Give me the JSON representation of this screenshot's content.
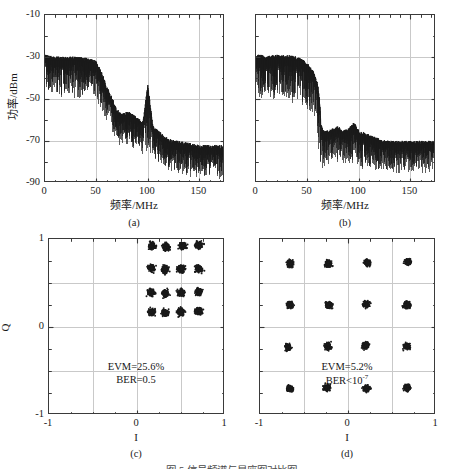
{
  "figure": {
    "caption": "图 5 信号频谱与星座图对比图",
    "panels": [
      {
        "id": "a",
        "label": "(a)",
        "type": "spectrum",
        "xlabel": "频率/MHz",
        "ylabel": "功率/dBm"
      },
      {
        "id": "b",
        "label": "(b)",
        "type": "spectrum",
        "xlabel": "频率/MHz",
        "ylabel": ""
      },
      {
        "id": "c",
        "label": "(c)",
        "type": "constellation",
        "xlabel": "I",
        "ylabel": "Q",
        "evm": "EVM=25.6%",
        "ber": "BER=0.5"
      },
      {
        "id": "d",
        "label": "(d)",
        "type": "constellation",
        "xlabel": "I",
        "ylabel": "",
        "evm": "EVM=5.2%",
        "ber_prefix": "BER<10",
        "ber_exponent": "-7"
      }
    ]
  },
  "colors": {
    "trace": "#1a1a1a",
    "frame": "#3a3a3a",
    "grid": "#c9c9c9",
    "background": "#ffffff"
  },
  "chart_data": [
    {
      "type": "line",
      "panel": "a",
      "title": "",
      "xlabel": "频率/MHz",
      "ylabel": "功率/dBm",
      "xlim": [
        0,
        175
      ],
      "ylim": [
        -90,
        -10
      ],
      "xticks": [
        0,
        50,
        100,
        150
      ],
      "yticks": [
        -10,
        -30,
        -50,
        -70,
        -90
      ],
      "xticklabels": [
        "0",
        "50",
        "100",
        "150"
      ],
      "yticklabels": [
        "-10",
        "-30",
        "-50",
        "-70",
        "-90"
      ],
      "grid": true,
      "legend": null,
      "description": "RF spectrum: flat passband near -32 dBm from 0 to ~50 MHz, roll-off to ~-60 dBm by 70 MHz, spur at 100 MHz reaching -44 dBm, noise floor descending to about -76 dBm by 175 MHz",
      "envelope": {
        "x": [
          0,
          5,
          10,
          15,
          20,
          25,
          30,
          35,
          40,
          45,
          50,
          55,
          60,
          65,
          70,
          75,
          80,
          85,
          90,
          95,
          100,
          105,
          110,
          115,
          120,
          130,
          140,
          150,
          160,
          175
        ],
        "y_top": [
          -30,
          -30.5,
          -31,
          -30.8,
          -31,
          -30.7,
          -31,
          -31.2,
          -31.5,
          -32,
          -33,
          -38,
          -45,
          -50,
          -56,
          -58,
          -57,
          -58,
          -60,
          -62,
          -44,
          -64,
          -66,
          -68,
          -70,
          -71,
          -72,
          -73,
          -73,
          -73
        ],
        "y_bottom": [
          -44,
          -48,
          -46,
          -50,
          -47,
          -49,
          -48,
          -50,
          -47,
          -49,
          -51,
          -56,
          -62,
          -66,
          -70,
          -72,
          -71,
          -73,
          -74,
          -76,
          -76,
          -78,
          -80,
          -82,
          -84,
          -85,
          -86,
          -87,
          -87,
          -87
        ]
      },
      "markers": [
        {
          "label": "spur",
          "x": 100,
          "y": -44
        }
      ]
    },
    {
      "type": "line",
      "panel": "b",
      "title": "",
      "xlabel": "频率/MHz",
      "ylabel": "功率/dBm",
      "xlim": [
        0,
        175
      ],
      "ylim": [
        -90,
        -10
      ],
      "xticks": [
        0,
        50,
        100,
        150
      ],
      "yticks": [
        -10,
        -30,
        -50,
        -70,
        -90
      ],
      "xticklabels": [
        "0",
        "50",
        "100",
        "150"
      ],
      "yticklabels": [],
      "grid": true,
      "legend": null,
      "description": "RF spectrum: flat passband near -30 dBm from 0 to ~55 MHz, sharp cliff at 63 MHz down to about -66 dBm, then a flat noise floor near -72 dBm out to 175 MHz",
      "envelope": {
        "x": [
          0,
          5,
          10,
          15,
          20,
          25,
          30,
          35,
          40,
          45,
          50,
          55,
          58,
          60,
          62,
          63,
          65,
          70,
          75,
          80,
          85,
          90,
          95,
          100,
          110,
          120,
          130,
          140,
          150,
          160,
          175
        ],
        "y_top": [
          -30,
          -30,
          -30.5,
          -30.2,
          -30,
          -30.3,
          -30,
          -30.5,
          -31,
          -32,
          -34,
          -37,
          -40,
          -44,
          -52,
          -62,
          -66,
          -66,
          -65,
          -64,
          -66,
          -65,
          -62,
          -66,
          -68,
          -70,
          -71,
          -71,
          -71,
          -71,
          -71
        ],
        "y_bottom": [
          -46,
          -50,
          -48,
          -51,
          -49,
          -50,
          -48,
          -51,
          -49,
          -52,
          -54,
          -58,
          -62,
          -70,
          -78,
          -84,
          -82,
          -80,
          -78,
          -79,
          -80,
          -81,
          -79,
          -82,
          -83,
          -84,
          -84,
          -85,
          -84,
          -85,
          -84
        ]
      },
      "markers": []
    },
    {
      "type": "scatter",
      "panel": "c",
      "title": "",
      "xlabel": "I",
      "ylabel": "Q",
      "xlim": [
        -1,
        1
      ],
      "ylim": [
        -1,
        1
      ],
      "xticks": [
        -1,
        0,
        1
      ],
      "yticks": [
        -1,
        0,
        1
      ],
      "xticklabels": [
        "-1",
        "0",
        "1"
      ],
      "yticklabels": [
        "-1",
        "0",
        "1"
      ],
      "grid": true,
      "legend": null,
      "modulation": "16-QAM",
      "description": "Severely distorted 16-QAM constellation; all 16 clusters are compressed into the upper-right quadrant with large scatter, indicating failed demodulation",
      "annotations": [
        "EVM=25.6%",
        "BER=0.5"
      ],
      "cluster_centers": [
        [
          0.17,
          0.92
        ],
        [
          0.33,
          0.91
        ],
        [
          0.52,
          0.92
        ],
        [
          0.7,
          0.93
        ],
        [
          0.16,
          0.67
        ],
        [
          0.32,
          0.65
        ],
        [
          0.5,
          0.66
        ],
        [
          0.7,
          0.66
        ],
        [
          0.16,
          0.39
        ],
        [
          0.32,
          0.38
        ],
        [
          0.5,
          0.39
        ],
        [
          0.7,
          0.4
        ],
        [
          0.17,
          0.17
        ],
        [
          0.32,
          0.16
        ],
        [
          0.5,
          0.17
        ],
        [
          0.7,
          0.18
        ]
      ],
      "cluster_spread": 0.055
    },
    {
      "type": "scatter",
      "panel": "d",
      "title": "",
      "xlabel": "I",
      "ylabel": "Q",
      "xlim": [
        -1,
        1
      ],
      "ylim": [
        -1,
        1
      ],
      "xticks": [
        -1,
        0,
        1
      ],
      "yticks": [
        -1,
        0,
        1
      ],
      "xticklabels": [
        "-1",
        "0",
        "1"
      ],
      "yticklabels": [],
      "grid": true,
      "legend": null,
      "modulation": "16-QAM",
      "description": "Clean 16-QAM constellation; 16 tight well-separated clusters arranged in a regular 4x4 grid",
      "annotations": [
        "EVM=5.2%",
        "BER<10^-7"
      ],
      "cluster_centers": [
        [
          -0.66,
          0.72
        ],
        [
          -0.22,
          0.72
        ],
        [
          0.22,
          0.73
        ],
        [
          0.68,
          0.74
        ],
        [
          -0.66,
          0.25
        ],
        [
          -0.22,
          0.25
        ],
        [
          0.21,
          0.26
        ],
        [
          0.67,
          0.25
        ],
        [
          -0.68,
          -0.23
        ],
        [
          -0.23,
          -0.22
        ],
        [
          0.2,
          -0.21
        ],
        [
          0.67,
          -0.22
        ],
        [
          -0.66,
          -0.7
        ],
        [
          -0.24,
          -0.69
        ],
        [
          0.21,
          -0.7
        ],
        [
          0.67,
          -0.69
        ]
      ],
      "cluster_spread": 0.05
    }
  ]
}
